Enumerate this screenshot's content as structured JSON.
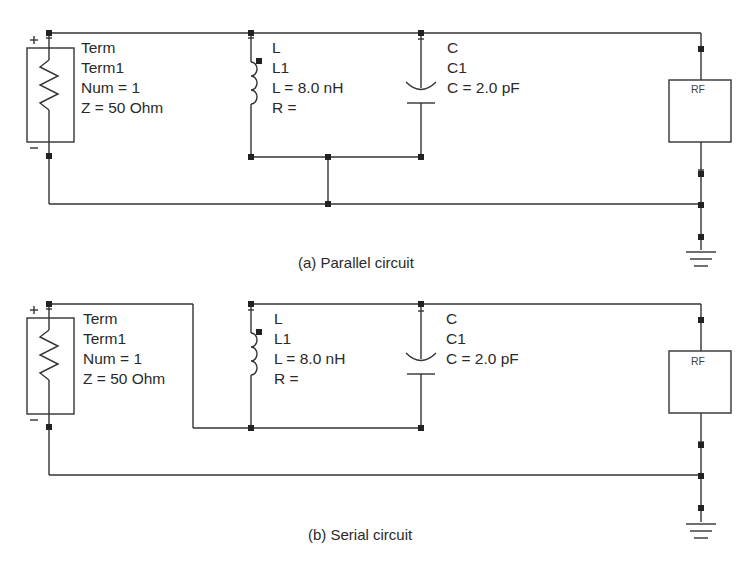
{
  "figure": {
    "colors": {
      "wire": "#333333",
      "node": "#222222",
      "text": "#2a2a2a",
      "background": "#ffffff"
    },
    "circuits": [
      {
        "id": "parallel",
        "caption": "(a) Parallel circuit",
        "term": {
          "type": "Term",
          "name": "Term1",
          "num": "Num = 1",
          "impedance": "Z = 50 Ohm",
          "plus": "+",
          "minus": "−"
        },
        "inductor": {
          "type": "L",
          "name": "L1",
          "value": "L = 8.0 nH",
          "resistance": "R ="
        },
        "capacitor": {
          "type": "C",
          "name": "C1",
          "value": "C = 2.0 pF"
        },
        "rf_block": {
          "label": "RF"
        },
        "ground": "ground-symbol"
      },
      {
        "id": "serial",
        "caption": "(b) Serial circuit",
        "term": {
          "type": "Term",
          "name": "Term1",
          "num": "Num = 1",
          "impedance": "Z = 50 Ohm",
          "plus": "+",
          "minus": "−"
        },
        "inductor": {
          "type": "L",
          "name": "L1",
          "value": "L = 8.0 nH",
          "resistance": "R ="
        },
        "capacitor": {
          "type": "C",
          "name": "C1",
          "value": "C = 2.0 pF"
        },
        "rf_block": {
          "label": "RF"
        },
        "ground": "ground-symbol"
      }
    ]
  }
}
